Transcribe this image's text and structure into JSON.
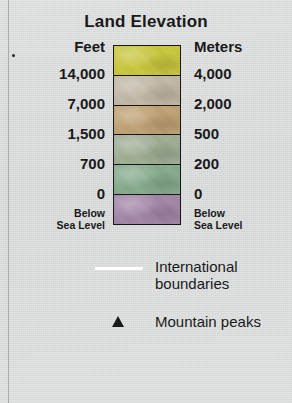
{
  "legend": {
    "title": "Land Elevation",
    "columns": {
      "left_header": "Feet",
      "right_header": "Meters"
    },
    "bands": [
      {
        "color": "#c9c83c",
        "feet_below": "14,000",
        "meters_below": "4,000"
      },
      {
        "color": "#c2b9a7",
        "feet_below": "7,000",
        "meters_below": "2,000"
      },
      {
        "color": "#c0a274",
        "feet_below": "1,500",
        "meters_below": "500"
      },
      {
        "color": "#9fae95",
        "feet_below": "700",
        "meters_below": "200"
      },
      {
        "color": "#86ab8d",
        "feet_below": "0",
        "meters_below": "0"
      },
      {
        "color": "#a386a8",
        "feet_below": "",
        "meters_below": ""
      }
    ],
    "below_sea_level": {
      "line1": "Below",
      "line2": "Sea Level"
    },
    "symbols": [
      {
        "icon": "white-line-icon",
        "label_line1": "International",
        "label_line2": "boundaries",
        "color": "#ffffff"
      },
      {
        "icon": "black-triangle-icon",
        "label_line1": "Mountain peaks",
        "label_line2": "",
        "color": "#1a1a1a"
      }
    ]
  },
  "page": {
    "background_color": "#d8dbda",
    "text_color": "#19191b",
    "outline_color": "#161616"
  }
}
